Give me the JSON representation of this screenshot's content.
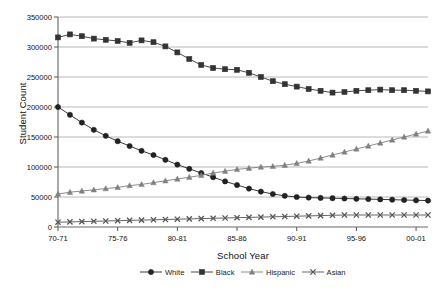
{
  "chart_data": {
    "type": "line",
    "title": "",
    "xlabel": "School Year",
    "ylabel": "Student Count",
    "ylim": [
      0,
      350000
    ],
    "ytick_values": [
      0,
      50000,
      100000,
      150000,
      200000,
      250000,
      300000,
      350000
    ],
    "ytick_labels": [
      "0",
      "50000",
      "100000",
      "150000",
      "200000",
      "250000",
      "300000",
      "350000"
    ],
    "grid": true,
    "grid_axis": "y",
    "legend_position": "bottom",
    "x": [
      "70-71",
      "71-72",
      "72-73",
      "73-74",
      "74-75",
      "75-76",
      "76-77",
      "77-78",
      "78-79",
      "79-80",
      "80-81",
      "81-82",
      "82-83",
      "83-84",
      "84-85",
      "85-86",
      "86-87",
      "87-88",
      "88-89",
      "89-90",
      "90-91",
      "91-92",
      "92-93",
      "93-94",
      "94-95",
      "95-96",
      "96-97",
      "97-98",
      "98-99",
      "99-00",
      "00-01",
      "01-02"
    ],
    "xtick_labels": [
      "70-71",
      "75-76",
      "80-81",
      "85-86",
      "90-91",
      "95-96",
      "00-01"
    ],
    "xtick_indices": [
      0,
      5,
      10,
      15,
      20,
      25,
      30
    ],
    "series": [
      {
        "name": "White",
        "marker": "circle",
        "color": "#222222",
        "values": [
          200000,
          187000,
          174000,
          162000,
          152000,
          143000,
          135000,
          127000,
          120000,
          112000,
          104000,
          97000,
          90000,
          83000,
          76000,
          70000,
          64000,
          59000,
          55000,
          52000,
          50000,
          49000,
          48500,
          48000,
          47500,
          47000,
          46500,
          46000,
          45500,
          45000,
          44500,
          44000
        ]
      },
      {
        "name": "Black",
        "marker": "square",
        "color": "#333333",
        "values": [
          316000,
          321000,
          318000,
          314000,
          312000,
          310000,
          307000,
          311000,
          308000,
          301000,
          291000,
          280000,
          270000,
          265000,
          263000,
          262000,
          257000,
          250000,
          243000,
          238000,
          234000,
          230000,
          227000,
          224000,
          225000,
          227000,
          228000,
          229000,
          228000,
          228000,
          227000,
          226000
        ]
      },
      {
        "name": "Hispanic",
        "marker": "triangle",
        "color": "#808080",
        "values": [
          55000,
          58000,
          60000,
          62000,
          64000,
          66000,
          69000,
          71000,
          74000,
          77000,
          80000,
          83000,
          86000,
          90000,
          93000,
          96000,
          98000,
          100000,
          101000,
          103000,
          106000,
          110000,
          115000,
          120000,
          125000,
          130000,
          135000,
          140000,
          145000,
          150000,
          155000,
          160000
        ]
      },
      {
        "name": "Asian",
        "marker": "cross",
        "color": "#555555",
        "values": [
          8000,
          8500,
          9000,
          9500,
          10000,
          10500,
          11000,
          11500,
          12000,
          12500,
          13000,
          13500,
          14000,
          14500,
          15000,
          15500,
          16000,
          16500,
          17000,
          17500,
          18000,
          18500,
          19000,
          19500,
          20000,
          20000,
          20000,
          20000,
          20000,
          20000,
          20000,
          20000
        ]
      }
    ]
  }
}
